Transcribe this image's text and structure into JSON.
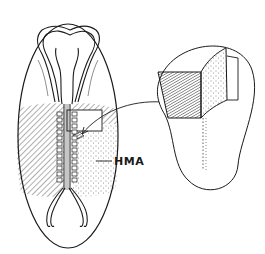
{
  "figure": {
    "labels": {
      "hma": "HMA"
    },
    "colors": {
      "ink": "#1a1a1a",
      "background": "#ffffff"
    },
    "parts": [
      "embryo-outline",
      "neural-folds",
      "somites",
      "hatched-region",
      "stippled-region-hma",
      "excision-window",
      "arrow",
      "inset-explant"
    ]
  }
}
